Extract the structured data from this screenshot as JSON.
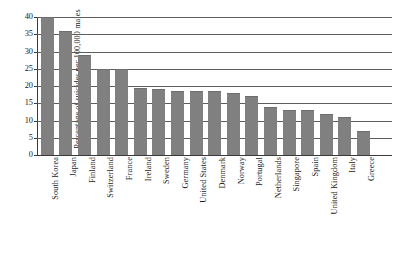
{
  "chart_data": {
    "type": "bar",
    "title": "",
    "xlabel": "",
    "ylabel": "Percentage of suicides per 100,000 males",
    "ylim": [
      0,
      40
    ],
    "yticks": [
      0,
      5,
      10,
      15,
      20,
      25,
      30,
      35,
      40
    ],
    "grid": "horizontal",
    "legend": "none",
    "bar_color": "#808080",
    "categories": [
      "South Korea",
      "Japan",
      "Finland",
      "Switzerland",
      "France",
      "Ireland",
      "Sweden",
      "Germany",
      "United States",
      "Denmark",
      "Norway",
      "Portugal",
      "Netherlands",
      "Singapore",
      "Spain",
      "United Kingdom",
      "Italy",
      "Greece"
    ],
    "values": [
      40,
      36,
      29,
      25,
      25,
      19.5,
      19,
      18.5,
      18.5,
      18.5,
      18,
      17,
      14,
      13,
      13,
      12,
      11,
      7
    ]
  }
}
